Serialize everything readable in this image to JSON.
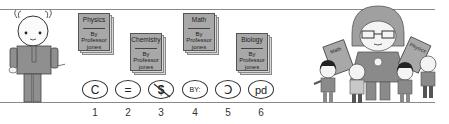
{
  "books": [
    {
      "subject": "Physics",
      "author_line1": "By",
      "author_line2": "Professor",
      "author_line3": "jones"
    },
    {
      "subject": "Chemistry",
      "author_line1": "By",
      "author_line2": "Professor",
      "author_line3": "jones"
    },
    {
      "subject": "Math",
      "author_line1": "By",
      "author_line2": "Professor",
      "author_line3": "jones"
    },
    {
      "subject": "Biology",
      "author_line1": "By",
      "author_line2": "Professor",
      "author_line3": "jones"
    }
  ],
  "license_icons": [
    {
      "name": "copyright",
      "glyph": "C",
      "number": "1"
    },
    {
      "name": "no-derivatives",
      "glyph": "=",
      "number": "2"
    },
    {
      "name": "non-commercial",
      "glyph": "$",
      "number": "3"
    },
    {
      "name": "attribution",
      "glyph": "BY:",
      "number": "4"
    },
    {
      "name": "share-alike",
      "glyph": "Ↄ",
      "number": "5"
    },
    {
      "name": "public-domain",
      "glyph": "pd",
      "number": "6"
    }
  ],
  "teacher_books": [
    {
      "subject": "Math"
    },
    {
      "subject": "Physics"
    }
  ],
  "colors": {
    "line": "#8a8a8a",
    "book_cover": "#a8a8a8",
    "figure_body": "#8f8f8f",
    "skin": "#f2f2f2"
  }
}
